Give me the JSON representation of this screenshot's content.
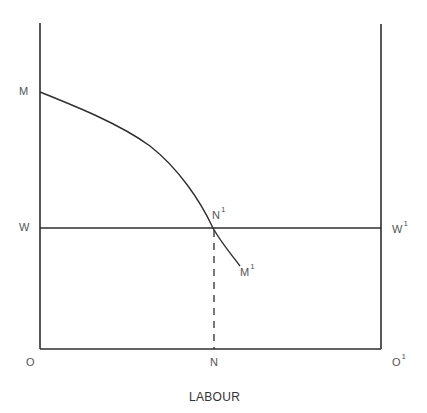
{
  "diagram": {
    "type": "labour-market-diagram",
    "axis_title": "LABOUR",
    "labels": {
      "M": "M",
      "W": "W",
      "W_prime": "W",
      "W_prime_sup": "1",
      "N_prime": "N",
      "N_prime_sup": "1",
      "M_prime": "M",
      "M_prime_sup": "1",
      "O": "O",
      "N": "N",
      "O_prime": "O",
      "O_prime_sup": "1"
    },
    "elements": [
      {
        "id": "left-axis",
        "kind": "vertical-line",
        "from": "O",
        "to": "top"
      },
      {
        "id": "right-axis",
        "kind": "vertical-line",
        "from": "O'",
        "to": "top"
      },
      {
        "id": "base-axis",
        "kind": "horizontal-line",
        "from": "O",
        "to": "O'"
      },
      {
        "id": "wage-line",
        "kind": "horizontal-line",
        "from": "W",
        "to": "W'"
      },
      {
        "id": "mrp-curve",
        "kind": "curve",
        "from": "M",
        "through": "N'",
        "to": "M'"
      },
      {
        "id": "employment-dropline",
        "kind": "dashed-line",
        "from": "N'",
        "to": "N"
      }
    ],
    "colors": {
      "line": "#2e2e2e",
      "text": "#555555",
      "background": "#ffffff"
    }
  }
}
